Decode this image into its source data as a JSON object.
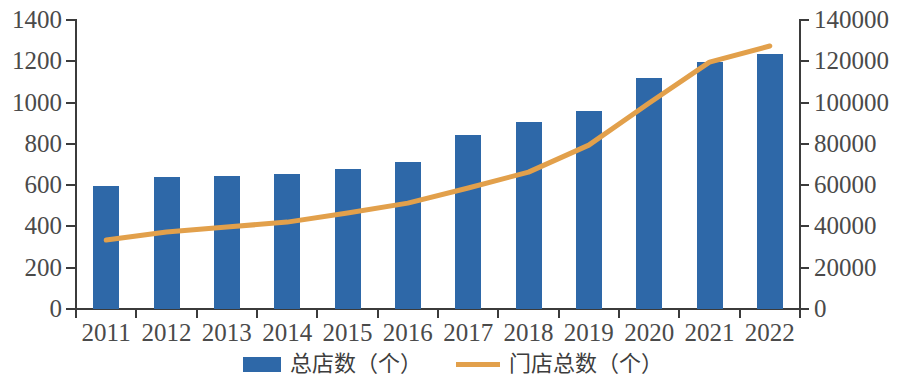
{
  "chart_data": {
    "type": "bar",
    "title": "",
    "subtitle": "",
    "xlabel": "",
    "ylabel": "",
    "y2label": "",
    "grid": false,
    "legend_position": "bottom",
    "categories": [
      "2011",
      "2012",
      "2013",
      "2014",
      "2015",
      "2016",
      "2017",
      "2018",
      "2019",
      "2020",
      "2021",
      "2022"
    ],
    "series": [
      {
        "name": "总店数（个）",
        "type": "bar",
        "axis": "left",
        "color": "#2e68a8",
        "values": [
          595,
          640,
          645,
          655,
          680,
          710,
          845,
          905,
          958,
          1118,
          1195,
          1235
        ]
      },
      {
        "name": "门店总数（个）",
        "type": "line",
        "axis": "right",
        "color": "#e2a04b",
        "values": [
          33400,
          37300,
          39700,
          42100,
          46500,
          51300,
          58600,
          66300,
          79400,
          99800,
          119600,
          127400
        ]
      }
    ],
    "y_axis_left": {
      "min": 0,
      "max": 1400,
      "step": 200,
      "ticks": [
        "0",
        "200",
        "400",
        "600",
        "800",
        "1000",
        "1200",
        "1400"
      ]
    },
    "y_axis_right": {
      "min": 0,
      "max": 140000,
      "step": 20000,
      "ticks": [
        "0",
        "20000",
        "40000",
        "60000",
        "80000",
        "100000",
        "120000",
        "140000"
      ]
    },
    "legend": [
      {
        "label": "总店数（个）",
        "marker": "bar-swatch",
        "color": "#2e68a8"
      },
      {
        "label": "门店总数（个）",
        "marker": "line-swatch",
        "color": "#e2a04b"
      }
    ]
  }
}
